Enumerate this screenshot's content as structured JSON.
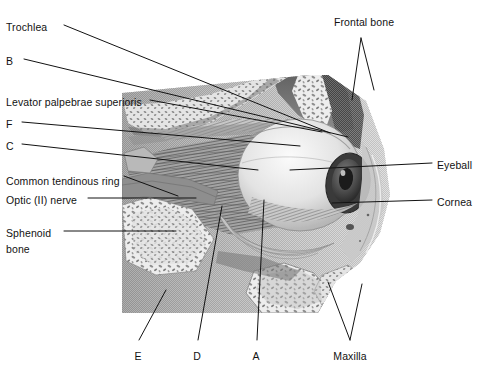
{
  "figure": {
    "kind": "anatomical-illustration",
    "background_color": "#ffffff",
    "ink_color": "#121212"
  },
  "labels": {
    "left": [
      {
        "id": "trochlea",
        "text": "Trochlea",
        "x": 6,
        "y": 21
      },
      {
        "id": "b",
        "text": "B",
        "x": 6,
        "y": 55
      },
      {
        "id": "levator",
        "text": "Levator palpebrae superioris",
        "x": 6,
        "y": 96
      },
      {
        "id": "f",
        "text": "F",
        "x": 6,
        "y": 118
      },
      {
        "id": "c",
        "text": "C",
        "x": 6,
        "y": 140
      },
      {
        "id": "ctr",
        "text": "Common tendinous ring",
        "x": 6,
        "y": 175
      },
      {
        "id": "optic",
        "text": "Optic (II) nerve",
        "x": 6,
        "y": 194
      },
      {
        "id": "sphenoid1",
        "text": "Sphenoid",
        "x": 6,
        "y": 227
      },
      {
        "id": "sphenoid2",
        "text": "bone",
        "x": 6,
        "y": 243
      }
    ],
    "right": [
      {
        "id": "eyeball",
        "text": "Eyeball",
        "x": 437,
        "y": 159
      },
      {
        "id": "cornea",
        "text": "Cornea",
        "x": 437,
        "y": 196
      }
    ],
    "top": [
      {
        "id": "frontal-bone",
        "text": "Frontal bone",
        "x": 364,
        "y": 16
      }
    ],
    "bottom": [
      {
        "id": "e",
        "text": "E",
        "x": 138,
        "y": 350
      },
      {
        "id": "d",
        "text": "D",
        "x": 197,
        "y": 350
      },
      {
        "id": "a",
        "text": "A",
        "x": 256,
        "y": 350
      },
      {
        "id": "maxilla",
        "text": "Maxilla",
        "x": 350,
        "y": 350
      }
    ]
  },
  "leaders": [
    {
      "id": "leader-trochlea",
      "points": "64,25 330,133"
    },
    {
      "id": "leader-b",
      "points": "24,59 348,137"
    },
    {
      "id": "leader-levator",
      "points": "150,100 322,132"
    },
    {
      "id": "leader-f",
      "points": "22,122 300,146"
    },
    {
      "id": "leader-c",
      "points": "22,144 258,170"
    },
    {
      "id": "leader-ctr",
      "points": "124,176 178,196"
    },
    {
      "id": "leader-optic",
      "points": "88,198 196,198"
    },
    {
      "id": "leader-sphenoid",
      "points": "64,231 176,231"
    },
    {
      "id": "leader-eyeball",
      "points": "432,163 290,170"
    },
    {
      "id": "leader-cornea",
      "points": "432,200 332,203"
    },
    {
      "id": "leader-frontal-a",
      "points": "361,38 352,100"
    },
    {
      "id": "leader-frontal-b",
      "points": "361,38 374,90"
    },
    {
      "id": "leader-e",
      "points": "139,340 166,290"
    },
    {
      "id": "leader-d",
      "points": "198,340 222,206"
    },
    {
      "id": "leader-a",
      "points": "257,340 264,200"
    },
    {
      "id": "leader-maxilla-a",
      "points": "350,340 328,282"
    },
    {
      "id": "leader-maxilla-b",
      "points": "350,340 362,284"
    }
  ],
  "illustration": {
    "bounds": {
      "x": 122,
      "y": 75,
      "width": 278,
      "height": 238
    },
    "regions": [
      {
        "name": "frontal-bone-cancellous",
        "tone": "light-stipple"
      },
      {
        "name": "orbital-roof",
        "tone": "mid-gray"
      },
      {
        "name": "eyeball-sclera",
        "tone": "light-highlight"
      },
      {
        "name": "cornea-iris-pupil",
        "tone": "dark"
      },
      {
        "name": "extraocular-muscle-cone",
        "tone": "striated-mid"
      },
      {
        "name": "optic-nerve",
        "tone": "mid-gray"
      },
      {
        "name": "sphenoid-bone-cancellous",
        "tone": "stipple"
      },
      {
        "name": "maxilla-cancellous",
        "tone": "stipple"
      },
      {
        "name": "eyelid-soft-tissue",
        "tone": "light-mid"
      },
      {
        "name": "inferior-oblique",
        "tone": "striated-light"
      }
    ]
  }
}
